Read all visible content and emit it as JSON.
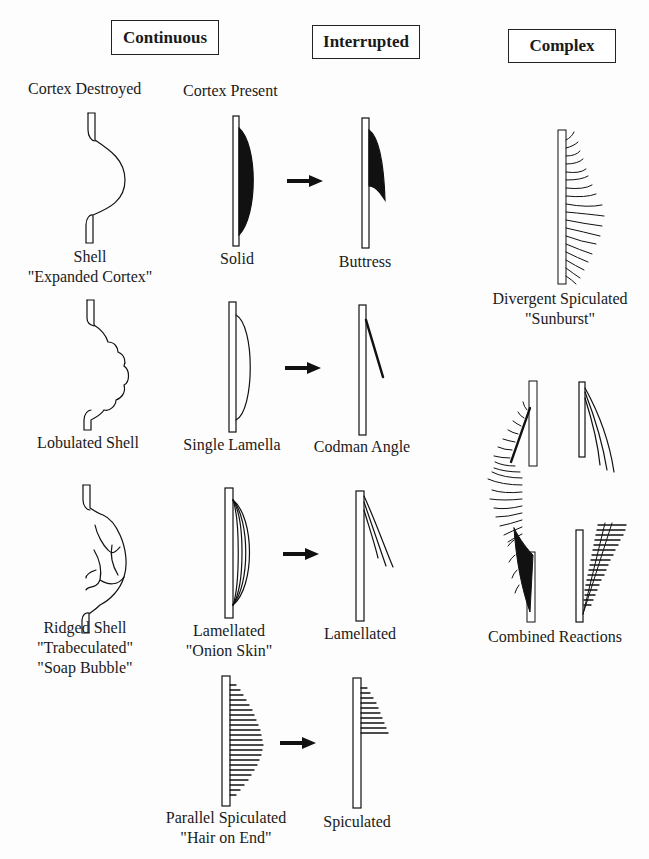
{
  "headers": {
    "continuous": "Continuous",
    "interrupted": "Interrupted",
    "complex": "Complex"
  },
  "subheaders": {
    "cortex_destroyed": "Cortex Destroyed",
    "cortex_present": "Cortex Present"
  },
  "labels": {
    "shell": [
      "Shell",
      "\"Expanded Cortex\""
    ],
    "solid": [
      "Solid"
    ],
    "buttress": [
      "Buttress"
    ],
    "sunburst": [
      "Divergent Spiculated",
      "\"Sunburst\""
    ],
    "lobulated_shell": [
      "Lobulated Shell"
    ],
    "single_lamella": [
      "Single Lamella"
    ],
    "codman_angle": [
      "Codman Angle"
    ],
    "ridged_shell": [
      "Ridged Shell",
      "\"Trabeculated\"",
      "\"Soap Bubble\""
    ],
    "lamellated_onion": [
      "Lamellated",
      "\"Onion Skin\""
    ],
    "lamellated_interrupted": [
      "Lamellated"
    ],
    "combined_reactions": [
      "Combined Reactions"
    ],
    "parallel_spiculated": [
      "Parallel Spiculated",
      "\"Hair on End\""
    ],
    "spiculated": [
      "Spiculated"
    ]
  },
  "arrows": [
    "solid-to-buttress",
    "single-lamella-to-codman-angle",
    "lamellated-to-lamellated",
    "parallel-spiculated-to-spiculated"
  ],
  "colors": {
    "ink": "#111111",
    "paper": "#fdfdfd"
  }
}
